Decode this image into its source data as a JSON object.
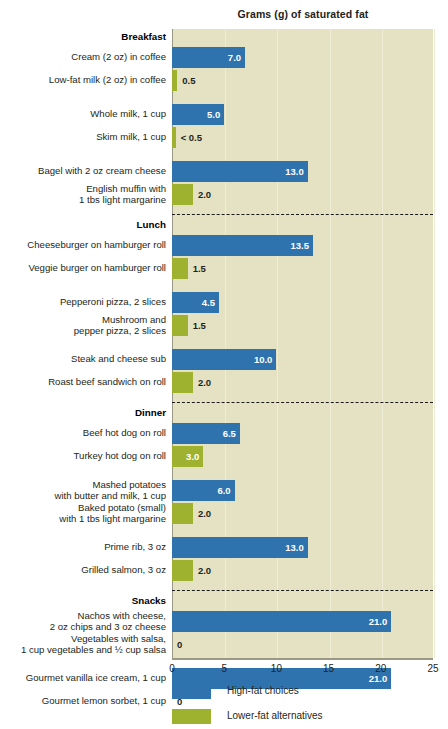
{
  "chart_data": {
    "type": "bar",
    "title": "Grams (g) of saturated fat",
    "orientation": "horizontal",
    "xlabel": "",
    "ylabel": "",
    "xlim": [
      0,
      25
    ],
    "xticks": [
      "0",
      "5",
      "10",
      "15",
      "20",
      "25"
    ],
    "grid": true,
    "legend_position": "bottom-left",
    "legend": [
      {
        "name": "High-fat choices",
        "color": "#2e72ae"
      },
      {
        "name": "Lower-fat alternatives",
        "color": "#9fb230"
      }
    ],
    "groups": [
      {
        "category": "Breakfast",
        "items": [
          {
            "label": "Cream (2 oz) in coffee",
            "value": 7.0,
            "value_label": "7.0",
            "series": "High-fat choices"
          },
          {
            "label": "Low-fat milk (2 oz) in coffee",
            "value": 0.5,
            "value_label": "0.5",
            "series": "Lower-fat alternatives"
          },
          {
            "label": "Whole milk, 1 cup",
            "value": 5.0,
            "value_label": "5.0",
            "series": "High-fat choices"
          },
          {
            "label": "Skim milk, 1 cup",
            "value": 0.35,
            "value_label": "< 0.5",
            "series": "Lower-fat alternatives"
          },
          {
            "label": "Bagel with 2 oz cream cheese",
            "value": 13.0,
            "value_label": "13.0",
            "series": "High-fat choices"
          },
          {
            "label": "English muffin with\n1 tbs light margarine",
            "value": 2.0,
            "value_label": "2.0",
            "series": "Lower-fat alternatives"
          }
        ]
      },
      {
        "category": "Lunch",
        "items": [
          {
            "label": "Cheeseburger on hamburger roll",
            "value": 13.5,
            "value_label": "13.5",
            "series": "High-fat choices"
          },
          {
            "label": "Veggie burger on hamburger roll",
            "value": 1.5,
            "value_label": "1.5",
            "series": "Lower-fat alternatives"
          },
          {
            "label": "Pepperoni pizza, 2 slices",
            "value": 4.5,
            "value_label": "4.5",
            "series": "High-fat choices"
          },
          {
            "label": "Mushroom and\npepper pizza, 2 slices",
            "value": 1.5,
            "value_label": "1.5",
            "series": "Lower-fat alternatives"
          },
          {
            "label": "Steak and cheese sub",
            "value": 10.0,
            "value_label": "10.0",
            "series": "High-fat choices"
          },
          {
            "label": "Roast beef sandwich on roll",
            "value": 2.0,
            "value_label": "2.0",
            "series": "Lower-fat alternatives"
          }
        ]
      },
      {
        "category": "Dinner",
        "items": [
          {
            "label": "Beef hot dog on roll",
            "value": 6.5,
            "value_label": "6.5",
            "series": "High-fat choices"
          },
          {
            "label": "Turkey hot dog on roll",
            "value": 3.0,
            "value_label": "3.0",
            "series": "Lower-fat alternatives"
          },
          {
            "label": "Mashed potatoes\nwith butter and milk, 1 cup",
            "value": 6.0,
            "value_label": "6.0",
            "series": "High-fat choices"
          },
          {
            "label": "Baked potato (small)\nwith 1 tbs light margarine",
            "value": 2.0,
            "value_label": "2.0",
            "series": "Lower-fat alternatives"
          },
          {
            "label": "Prime rib, 3 oz",
            "value": 13.0,
            "value_label": "13.0",
            "series": "High-fat choices"
          },
          {
            "label": "Grilled salmon, 3 oz",
            "value": 2.0,
            "value_label": "2.0",
            "series": "Lower-fat alternatives"
          }
        ]
      },
      {
        "category": "Snacks",
        "items": [
          {
            "label": "Nachos with cheese,\n2 oz chips and 3 oz cheese",
            "value": 21.0,
            "value_label": "21.0",
            "series": "High-fat choices"
          },
          {
            "label": "Vegetables with salsa,\n1 cup vegetables and ½ cup salsa",
            "value": 0,
            "value_label": "0",
            "series": "Lower-fat alternatives"
          },
          {
            "label": "Gourmet vanilla ice cream, 1 cup",
            "value": 21.0,
            "value_label": "21.0",
            "series": "High-fat choices"
          },
          {
            "label": "Gourmet lemon sorbet, 1 cup",
            "value": 0,
            "value_label": "0",
            "series": "Lower-fat alternatives"
          }
        ]
      }
    ]
  },
  "colors": {
    "high_fat": "#2e72ae",
    "lower_fat": "#9fb230",
    "plot_background": "#e4e2c2",
    "gridline": "#eeecd4",
    "axis": "#9a9a84",
    "text": "#231f20"
  }
}
